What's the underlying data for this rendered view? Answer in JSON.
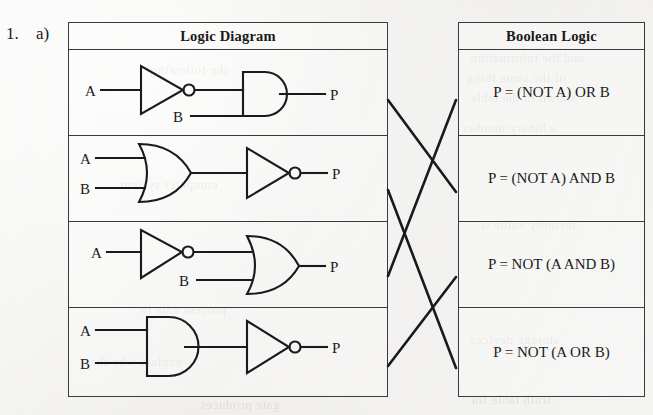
{
  "question": {
    "number": "1.",
    "part": "a)"
  },
  "left_table": {
    "header": "Logic Diagram",
    "rows": [
      {
        "id": "row1",
        "circuit": "NOT-then-AND",
        "inputs": [
          "A",
          "B"
        ],
        "output": "P",
        "input_a_label": "A",
        "input_b_label": "B",
        "output_label": "P"
      },
      {
        "id": "row2",
        "circuit": "OR-then-NOT",
        "inputs": [
          "A",
          "B"
        ],
        "output": "P",
        "input_a_label": "A",
        "input_b_label": "B",
        "output_label": "P"
      },
      {
        "id": "row3",
        "circuit": "NOT-then-OR",
        "inputs": [
          "A",
          "B"
        ],
        "output": "P",
        "input_a_label": "A",
        "input_b_label": "B",
        "output_label": "P"
      },
      {
        "id": "row4",
        "circuit": "AND-then-NOT",
        "inputs": [
          "A",
          "B"
        ],
        "output": "P",
        "input_a_label": "A",
        "input_b_label": "B",
        "output_label": "P"
      }
    ]
  },
  "right_table": {
    "header": "Boolean Logic",
    "rows": [
      {
        "id": "eq1",
        "expression": "P = (NOT A) OR B"
      },
      {
        "id": "eq2",
        "expression": "P = (NOT A) AND B"
      },
      {
        "id": "eq3",
        "expression": "P = NOT (A AND B)"
      },
      {
        "id": "eq4",
        "expression": "P = NOT (A OR B)"
      }
    ]
  },
  "match_lines": [
    {
      "from_row": 1,
      "to_row": 2,
      "x1": 388,
      "y1": 100,
      "x2": 456,
      "y2": 192
    },
    {
      "from_row": 2,
      "to_row": 4,
      "x1": 388,
      "y1": 190,
      "x2": 456,
      "y2": 368
    },
    {
      "from_row": 3,
      "to_row": 1,
      "x1": 388,
      "y1": 276,
      "x2": 456,
      "y2": 100
    },
    {
      "from_row": 4,
      "to_row": 3,
      "x1": 388,
      "y1": 366,
      "x2": 456,
      "y2": 277
    }
  ],
  "bleed_text": [
    {
      "text": "and the information",
      "x": 470,
      "y": 48
    },
    {
      "text": "of the same thing",
      "x": 466,
      "y": 68
    },
    {
      "text": "shown in the table",
      "x": 470,
      "y": 88
    },
    {
      "text": "a binary number",
      "x": 462,
      "y": 118
    },
    {
      "text": "the following",
      "x": 150,
      "y": 60
    },
    {
      "text": "computer system",
      "x": 120,
      "y": 175
    },
    {
      "text": "memory value is",
      "x": 480,
      "y": 215
    },
    {
      "text": "process data in",
      "x": 140,
      "y": 300
    },
    {
      "text": "explain why the",
      "x": 90,
      "y": 352
    },
    {
      "text": "storage devices",
      "x": 470,
      "y": 330
    },
    {
      "text": "gate produces",
      "x": 200,
      "y": 395
    },
    {
      "text": "truth table for",
      "x": 470,
      "y": 390
    }
  ],
  "colors": {
    "ink": "#1a1a1a",
    "rule": "#3a3a3a",
    "paper": "#f2f1ef"
  }
}
